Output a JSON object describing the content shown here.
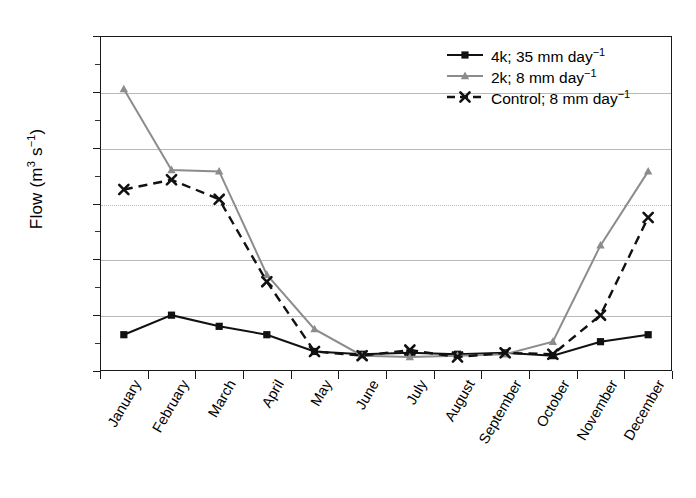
{
  "chart_data": {
    "type": "line",
    "title": "",
    "xlabel": "",
    "ylabel": "Flow (m3 s-1)",
    "ylabel_main": "Flow (m",
    "ylabel_sup1": "3",
    "ylabel_mid": " s",
    "ylabel_sup2": "−1",
    "ylabel_end": ")",
    "grid": true,
    "legend_position": "top-right",
    "ylim": [
      0,
      1.2
    ],
    "ytick_step": 0.2,
    "categories": [
      "January",
      "February",
      "March",
      "April",
      "May",
      "June",
      "July",
      "August",
      "September",
      "October",
      "November",
      "December"
    ],
    "ytick_labels": [
      "1.20",
      "1.00",
      "0.80",
      "0.60",
      "0.40",
      "0.20",
      "0.00"
    ],
    "ytick_values": [
      1.2,
      1.0,
      0.8,
      0.6,
      0.4,
      0.2,
      0.0
    ],
    "series": [
      {
        "name": "4k; 35 mm day-1",
        "label_main": "4k; 35 mm day",
        "label_sup": "−1",
        "color": "#111111",
        "marker": "square",
        "dash": "solid",
        "values": [
          0.13,
          0.2,
          0.16,
          0.13,
          0.07,
          0.06,
          0.065,
          0.06,
          0.065,
          0.055,
          0.105,
          0.13
        ]
      },
      {
        "name": "2k; 8 mm day-1",
        "label_main": "2k; 8 mm day",
        "label_sup": "−1",
        "color": "#8c8c8c",
        "marker": "triangle",
        "dash": "solid",
        "values": [
          1.01,
          0.72,
          0.715,
          0.345,
          0.15,
          0.055,
          0.05,
          0.055,
          0.06,
          0.105,
          0.45,
          0.715
        ]
      },
      {
        "name": "Control; 8 mm day-1",
        "label_main": "Control; 8 mm day",
        "label_sup": "−1",
        "color": "#111111",
        "marker": "cross",
        "dash": "dashed",
        "values": [
          0.65,
          0.685,
          0.615,
          0.32,
          0.07,
          0.055,
          0.075,
          0.05,
          0.065,
          0.06,
          0.2,
          0.55
        ]
      }
    ]
  }
}
